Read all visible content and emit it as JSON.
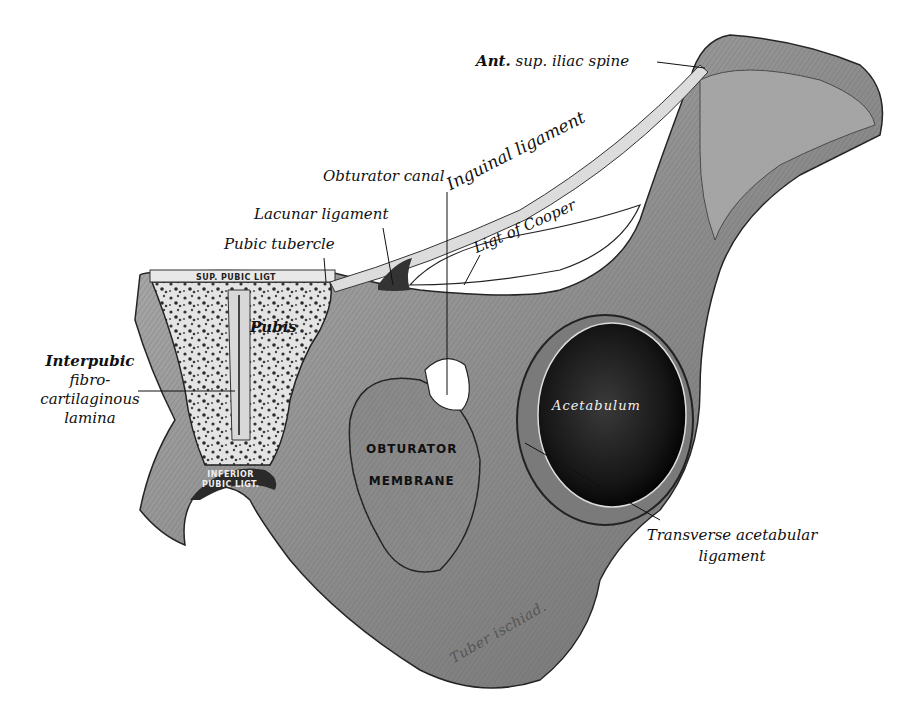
{
  "figure": {
    "colors": {
      "background": "#ffffff",
      "bone_light": "#c8c8c8",
      "bone_mid": "#9a9a9a",
      "bone_dark": "#555555",
      "cavity": "#1a1a1a",
      "ink": "#111111"
    }
  },
  "labels": {
    "ant_sup_iliac_spine": {
      "bold_part": "Ant.",
      "rest": " sup. iliac spine"
    },
    "obturator_canal": "Obturator canal",
    "inguinal_ligament": "Inguinal ligament",
    "ligt_of_cooper": "Ligt of Cooper",
    "lacunar_ligament": "Lacunar ligament",
    "pubic_tubercle": "Pubic tubercle",
    "interpubic": [
      "Interpubic",
      "fibro-",
      "cartilaginous",
      "lamina"
    ],
    "transverse_acetabular": [
      "Transverse acetabular",
      "ligament"
    ]
  },
  "inner_labels": {
    "sup_pubic_ligt": "SUP. PUBIC LIGT",
    "pubis": "Pubis",
    "inferior_pubic_ligt": [
      "INFERIOR",
      "PUBIC LIGT."
    ],
    "obturator_membrane": [
      "OBTURATOR",
      "MEMBRANE"
    ],
    "acetabulum": "Acetabulum",
    "tuber_ischiad": "Tuber ischiad."
  }
}
